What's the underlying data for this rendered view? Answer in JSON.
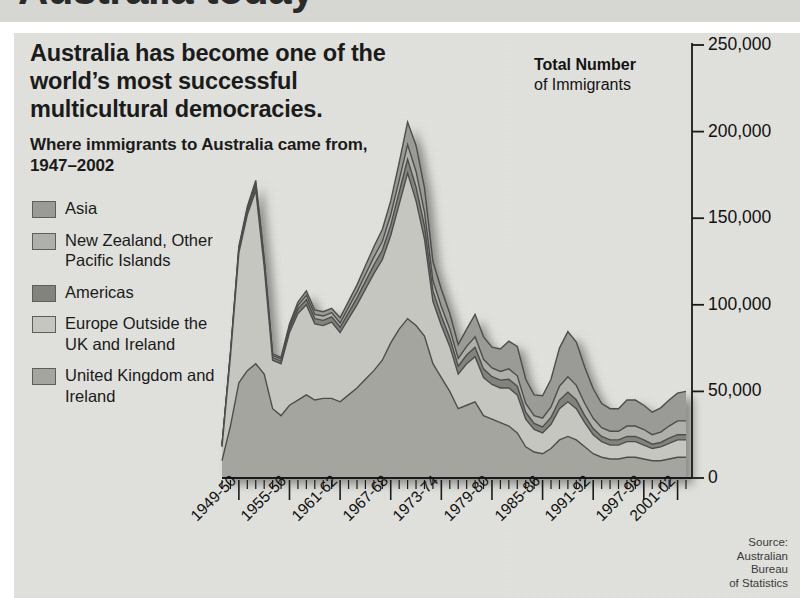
{
  "page": {
    "cut_off_headline": "Australia today",
    "background_color": "#e2e2de"
  },
  "headline": "Australia has become one of the world’s most successful multicultural democracies.",
  "subhead": "Where immigrants to Australia came from, 1947–2002",
  "axis_title": {
    "bold": "Total Number",
    "rest": "of Immigrants"
  },
  "source": "Source:\nAustralian\nBureau\nof Statistics",
  "legend": {
    "items": [
      {
        "label": "Asia",
        "color": "#9a9a96"
      },
      {
        "label": "New Zealand,\nOther Pacific\nIslands",
        "color": "#b0b0ab"
      },
      {
        "label": "Americas",
        "color": "#83837e"
      },
      {
        "label": "Europe\nOutside the\nUK and Ireland",
        "color": "#c6c6c1"
      },
      {
        "label": "United\nKingdom and\nIreland",
        "color": "#a5a5a0"
      }
    ]
  },
  "chart_data": {
    "type": "area",
    "stacked": true,
    "title": "Where immigrants to Australia came from, 1947–2002",
    "xlabel": "",
    "ylabel": "Total Number of Immigrants",
    "ylim": [
      0,
      250000
    ],
    "ytick_values": [
      0,
      50000,
      100000,
      150000,
      200000,
      250000
    ],
    "ytick_labels": [
      "0",
      "50,000",
      "100,000",
      "150,000",
      "200,000",
      "250,000"
    ],
    "grid": false,
    "legend_position": "left",
    "xtick_labels": [
      "1949-50",
      "1955-56",
      "1961-62",
      "1967-68",
      "1973-74",
      "1979-80",
      "1985-86",
      "1991-92",
      "1997-98",
      "2001-02"
    ],
    "xtick_years": [
      1949,
      1955,
      1961,
      1967,
      1973,
      1979,
      1985,
      1991,
      1997,
      2001
    ],
    "x": [
      1947,
      1948,
      1949,
      1950,
      1951,
      1952,
      1953,
      1954,
      1955,
      1956,
      1957,
      1958,
      1959,
      1960,
      1961,
      1962,
      1963,
      1964,
      1965,
      1966,
      1967,
      1968,
      1969,
      1970,
      1971,
      1972,
      1973,
      1974,
      1975,
      1976,
      1977,
      1978,
      1979,
      1980,
      1981,
      1982,
      1983,
      1984,
      1985,
      1986,
      1987,
      1988,
      1989,
      1990,
      1991,
      1992,
      1993,
      1994,
      1995,
      1996,
      1997,
      1998,
      1999,
      2000,
      2001,
      2002
    ],
    "series": [
      {
        "name": "United Kingdom and Ireland",
        "color": "#a5a5a0",
        "values": [
          10000,
          30000,
          55000,
          62000,
          66000,
          60000,
          40000,
          36000,
          42000,
          45000,
          48000,
          45000,
          46000,
          46000,
          44000,
          48000,
          52000,
          57000,
          62000,
          68000,
          78000,
          86000,
          92000,
          88000,
          82000,
          66000,
          58000,
          50000,
          40000,
          42000,
          44000,
          36000,
          34000,
          32000,
          30000,
          26000,
          18000,
          15000,
          14000,
          17000,
          22000,
          24000,
          22000,
          18000,
          14000,
          12000,
          11000,
          11000,
          12000,
          12000,
          11000,
          10000,
          10000,
          11000,
          12000,
          12000
        ]
      },
      {
        "name": "Europe Outside the UK and Ireland",
        "color": "#c6c6c1",
        "values": [
          8000,
          40000,
          75000,
          90000,
          100000,
          62000,
          28000,
          30000,
          42000,
          50000,
          52000,
          44000,
          42000,
          44000,
          40000,
          44000,
          48000,
          52000,
          56000,
          58000,
          62000,
          72000,
          84000,
          72000,
          56000,
          36000,
          30000,
          26000,
          20000,
          24000,
          26000,
          22000,
          20000,
          20000,
          22000,
          22000,
          16000,
          13000,
          12000,
          14000,
          18000,
          20000,
          18000,
          14000,
          11000,
          9000,
          8000,
          8000,
          9000,
          9000,
          8000,
          7000,
          8000,
          9000,
          10000,
          10000
        ]
      },
      {
        "name": "Americas",
        "color": "#83837e",
        "values": [
          500,
          1000,
          1500,
          2000,
          2500,
          2000,
          1500,
          1500,
          2000,
          2500,
          3000,
          3000,
          3000,
          3000,
          3000,
          3500,
          4000,
          4500,
          5000,
          5500,
          6000,
          7000,
          8000,
          8000,
          7500,
          6000,
          5500,
          5000,
          4500,
          5000,
          5500,
          5000,
          4500,
          4500,
          5000,
          5000,
          4000,
          3500,
          3500,
          4000,
          5000,
          5500,
          5000,
          4000,
          3500,
          3000,
          3000,
          3000,
          3000,
          3000,
          3000,
          2500,
          2500,
          3000,
          3000,
          3000
        ]
      },
      {
        "name": "New Zealand, Other Pacific Islands",
        "color": "#b0b0ab",
        "values": [
          500,
          800,
          1200,
          1500,
          1800,
          1500,
          1200,
          1200,
          1500,
          2000,
          2500,
          2500,
          2500,
          2500,
          2500,
          3000,
          3500,
          4000,
          4500,
          5000,
          6000,
          7000,
          8500,
          9000,
          8000,
          6000,
          5500,
          5000,
          4500,
          5000,
          6000,
          5500,
          5000,
          5000,
          6000,
          6000,
          5000,
          4500,
          5000,
          6000,
          8000,
          9000,
          8500,
          7000,
          6000,
          5000,
          5000,
          5000,
          6000,
          6000,
          6000,
          5500,
          6000,
          7000,
          8000,
          8000
        ]
      },
      {
        "name": "Asia",
        "color": "#9a9a96",
        "values": [
          300,
          600,
          1000,
          1200,
          1500,
          1200,
          1000,
          1000,
          1500,
          2000,
          2500,
          2500,
          2500,
          2500,
          3000,
          3500,
          4000,
          5000,
          6000,
          7000,
          8000,
          10000,
          13000,
          15000,
          14000,
          11000,
          10000,
          9000,
          8000,
          10000,
          13000,
          13000,
          12000,
          13000,
          16000,
          17000,
          14000,
          12000,
          13000,
          16000,
          22000,
          26000,
          25000,
          21000,
          17000,
          14000,
          13000,
          13000,
          15000,
          15000,
          14000,
          13000,
          14000,
          15000,
          16000,
          17000
        ]
      }
    ]
  }
}
